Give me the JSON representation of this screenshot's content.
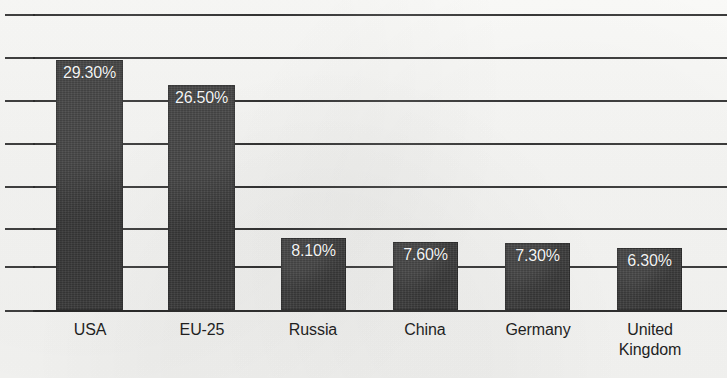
{
  "chart_data": {
    "type": "bar",
    "title": "",
    "subtitle": "",
    "xlabel": "",
    "ylabel": "",
    "categories": [
      "USA",
      "EU-25",
      "Russia",
      "China",
      "Germany",
      "United Kingdom"
    ],
    "values": [
      29.3,
      26.5,
      8.1,
      7.6,
      7.3,
      6.3
    ],
    "value_labels": [
      "29.30%",
      "26.50%",
      "8.10%",
      "7.60%",
      "7.30%",
      "6.30%"
    ],
    "unit": "%",
    "ylim": [
      0,
      35
    ],
    "y_tick_labels": [],
    "gridlines": 8,
    "grid": true,
    "legend": false,
    "legend_position": "none",
    "bar_color": "#3d3d3d",
    "value_label_color": "#f4f4f4",
    "background_color": "#f7f7f5",
    "axis_color": "#2b2b2b",
    "annotations": []
  },
  "bars": [
    {
      "label": "USA",
      "value_label": "29.30%",
      "x": 56,
      "width": 67,
      "top": 60,
      "label_x": 50,
      "label_width": 80
    },
    {
      "label": "EU-25",
      "value_label": "26.50%",
      "x": 168,
      "width": 67,
      "top": 85,
      "label_x": 162,
      "label_width": 80
    },
    {
      "label": "Russia",
      "value_label": "8.10%",
      "x": 281,
      "width": 65,
      "top": 238,
      "label_x": 273,
      "label_width": 80
    },
    {
      "label": "China",
      "value_label": "7.60%",
      "x": 393,
      "width": 65,
      "top": 242,
      "label_x": 385,
      "label_width": 80
    },
    {
      "label": "Germany",
      "value_label": "7.30%",
      "x": 505,
      "width": 65,
      "top": 243,
      "label_x": 492,
      "label_width": 92
    },
    {
      "label": "United\nKingdom",
      "value_label": "6.30%",
      "x": 617,
      "width": 65,
      "top": 248,
      "label_x": 604,
      "label_width": 92
    }
  ],
  "gridlines": [
    14,
    57,
    100,
    143,
    186,
    228,
    266,
    310
  ],
  "baseline_y": 310,
  "plot": {
    "left": 33,
    "right": 727
  }
}
